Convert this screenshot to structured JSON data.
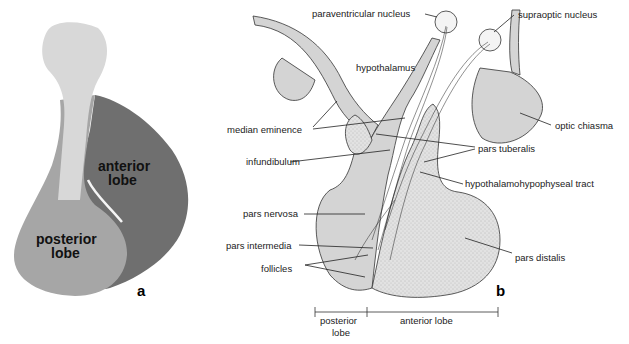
{
  "figure": {
    "panel_a": {
      "letter": "a",
      "labels": {
        "anterior_line1": "anterior",
        "anterior_line2": "lobe",
        "posterior_line1": "posterior",
        "posterior_line2": "lobe"
      }
    },
    "panel_b": {
      "letter": "b",
      "labels": {
        "paraventricular": "paraventricular nucleus",
        "supraoptic": "supraoptic nucleus",
        "hypothalamus": "hypothalamus",
        "median_eminence": "median eminence",
        "optic_chiasma": "optic chiasma",
        "pars_tuberalis": "pars tuberalis",
        "infundibulum": "infundibulum",
        "hh_tract": "hypothalamohypophyseal tract",
        "pars_nervosa": "pars nervosa",
        "pars_intermedia": "pars intermedia",
        "pars_distalis": "pars distalis",
        "follicles": "follicles"
      },
      "scale": {
        "posterior_line1": "posterior",
        "posterior_line2": "lobe",
        "anterior": "anterior lobe"
      }
    }
  }
}
